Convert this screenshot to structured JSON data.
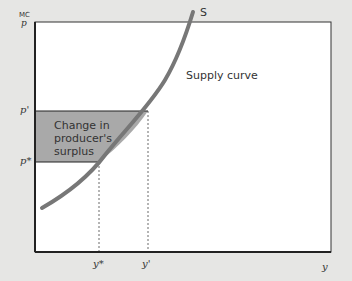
{
  "axes": {
    "y_label_top": "MC",
    "y_label_bottom": "p",
    "x_label": "y"
  },
  "ticks": {
    "p_prime": "p'",
    "p_star": "p*",
    "y_star": "y*",
    "y_prime": "y'"
  },
  "curve": {
    "name": "S",
    "label": "Supply curve"
  },
  "region": {
    "label_line1": "Change in",
    "label_line2": "producer's",
    "label_line3": "surplus"
  },
  "colors": {
    "background": "#e6e6e4",
    "plot": "#ffffff",
    "curve": "#777777",
    "shaded": "#a9a9a9"
  }
}
